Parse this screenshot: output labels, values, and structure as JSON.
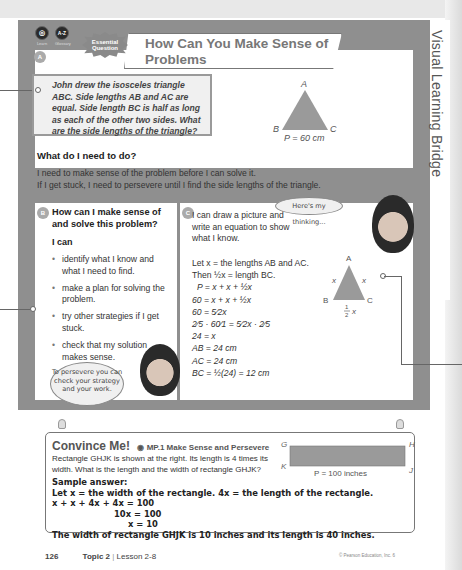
{
  "side_tab": {
    "label": "Visual Learning Bridge"
  },
  "header": {
    "icons": [
      {
        "name": "learn-icon",
        "glyph": "◎",
        "label": "Learn"
      },
      {
        "name": "glossary-icon",
        "glyph": "A-Z",
        "label": "Glossary"
      }
    ],
    "badge_line1": "Essential",
    "badge_line2": "Question",
    "title_line1": "How Can You Make Sense of Problems",
    "title_line2": "and Persevere in Solving Them?"
  },
  "section_a": {
    "marker": "A",
    "problem": "John drew the isosceles triangle ABC. Side lengths AB and AC are equal. Side length BC is half as long as each of the other two sides. What are the side lengths of the triangle?",
    "figure": {
      "vertex_a": "A",
      "vertex_b": "B",
      "vertex_c": "C",
      "perimeter": "P = 60 cm"
    },
    "need_title": "What do I need to do?",
    "need_line1": "I need to make sense of the problem before I can solve it.",
    "need_line2": "If I get stuck, I need to persevere until I find the side lengths of the triangle."
  },
  "section_b": {
    "marker": "B",
    "title": "How can I make sense of and solve this problem?",
    "ican": "I can",
    "bullets": [
      "identify what I know and what I need to find.",
      "make a plan for solving the problem.",
      "try other strategies if I get stuck.",
      "check that my solution makes sense."
    ],
    "bubble": "To persevere you can check your strategy and your work."
  },
  "section_c": {
    "marker": "C",
    "intro": "I can draw a picture and write an equation to show what I know.",
    "bubble": "Here's my thinking...",
    "let_line": "Let x = the lengths AB and AC.",
    "then_line": "Then ½x = length BC.",
    "steps": [
      "P = x + x + ½x",
      "60 = x + x + ½x",
      "60 = 5⁄2x",
      "2⁄5 · 60⁄1 = 5⁄2x · 2⁄5",
      "24 = x",
      "AB = 24 cm",
      "AC = 24 cm",
      "BC = ½(24) = 12 cm"
    ],
    "figure": {
      "vertex_a": "A",
      "vertex_b": "B",
      "vertex_c": "C",
      "side_left": "x",
      "side_right": "x",
      "base_num": "1",
      "base_den": "2",
      "base_var": "x"
    }
  },
  "convince_me": {
    "title": "Convince Me!",
    "practice": "MP.1 Make Sense and Persevere",
    "question": "Rectangle GHJK is shown at the right. Its length is 4 times its width. What is the length and the width of rectangle GHJK?",
    "figure": {
      "g": "G",
      "h": "H",
      "j": "J",
      "k": "K",
      "perimeter": "P = 100 inches"
    },
    "sample_label": "Sample answer:",
    "answer_lines": [
      "Let x = the width of the rectangle. 4x = the length of the rectangle.",
      "x + x + 4x + 4x = 100",
      "10x = 100",
      "x = 10",
      "The width of rectangle GHJK is 10 inches and its length is 40 inches."
    ]
  },
  "footer": {
    "page_number": "126",
    "topic": "Topic 2",
    "lesson": "Lesson 2-8",
    "copyright": "© Pearson Education, Inc. 6"
  }
}
